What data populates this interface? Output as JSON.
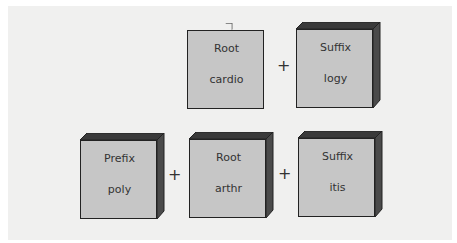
{
  "diagram": {
    "rows": [
      {
        "boxes": [
          {
            "role": "Root",
            "text": "cardio"
          },
          {
            "role": "Suffix",
            "text": "logy"
          }
        ],
        "operators": [
          "+"
        ]
      },
      {
        "boxes": [
          {
            "role": "Prefix",
            "text": "poly"
          },
          {
            "role": "Root",
            "text": "arthr"
          },
          {
            "role": "Suffix",
            "text": "itis"
          }
        ],
        "operators": [
          "+",
          "+"
        ]
      }
    ],
    "colors": {
      "box_face": "#c6c6c6",
      "box_shadow": "#3a3a3a",
      "panel": "#f0f0ef",
      "text": "#333333"
    }
  }
}
